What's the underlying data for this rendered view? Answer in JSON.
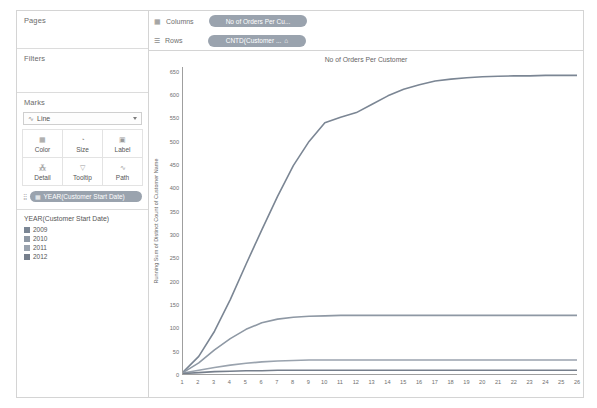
{
  "sidebar": {
    "pages": {
      "label": "Pages"
    },
    "filters": {
      "label": "Filters"
    },
    "marks": {
      "label": "Marks",
      "mark_type": "Line",
      "mark_type_glyph": "∿",
      "buttons": [
        {
          "name": "color",
          "label": "Color",
          "glyph": "▦"
        },
        {
          "name": "size",
          "label": "Size",
          "glyph": "◔"
        },
        {
          "name": "label",
          "label": "Label",
          "glyph": "▣"
        },
        {
          "name": "detail",
          "label": "Detail",
          "glyph": "⁂"
        },
        {
          "name": "tooltip",
          "label": "Tooltip",
          "glyph": "▽"
        },
        {
          "name": "path",
          "label": "Path",
          "glyph": "∿"
        }
      ],
      "pill": {
        "icon": "▦",
        "label": "YEAR(Customer Start Date)"
      }
    },
    "legend": {
      "title": "YEAR(Customer Start Date)",
      "items": [
        {
          "label": "2009",
          "color": "#7b8694"
        },
        {
          "label": "2010",
          "color": "#8e98a4"
        },
        {
          "label": "2011",
          "color": "#9aa3ae"
        },
        {
          "label": "2012",
          "color": "#767f8c"
        }
      ]
    }
  },
  "shelves": {
    "columns": {
      "icon": "▦",
      "label": "Columns",
      "pill": "No of Orders Per Cu..."
    },
    "rows": {
      "icon": "☰",
      "label": "Rows",
      "pill": "CNTD(Customer ...",
      "pill_suffix": "⌂"
    }
  },
  "chart_data": {
    "type": "line",
    "title": "No of Orders Per Customer",
    "xlabel": "",
    "ylabel": "Running Sum of Distinct Count of Customer Name",
    "xlim": [
      1,
      26
    ],
    "ylim": [
      0,
      660
    ],
    "grid": false,
    "legend_position": "sidebar",
    "y_ticks": [
      0,
      50,
      100,
      150,
      200,
      250,
      300,
      350,
      400,
      450,
      500,
      550,
      600,
      650
    ],
    "x_ticks": [
      1,
      2,
      3,
      4,
      5,
      6,
      7,
      8,
      9,
      10,
      11,
      12,
      13,
      14,
      15,
      16,
      17,
      18,
      19,
      20,
      21,
      22,
      23,
      24,
      25,
      26
    ],
    "x": [
      1,
      2,
      3,
      4,
      5,
      6,
      7,
      8,
      9,
      10,
      11,
      12,
      13,
      14,
      15,
      16,
      17,
      18,
      19,
      20,
      21,
      22,
      23,
      24,
      25,
      26
    ],
    "series": [
      {
        "name": "2009",
        "color": "#7b8694",
        "values": [
          4,
          38,
          92,
          160,
          236,
          310,
          382,
          448,
          500,
          540,
          552,
          562,
          580,
          598,
          612,
          622,
          630,
          634,
          637,
          639,
          640,
          641,
          641,
          642,
          642,
          642
        ]
      },
      {
        "name": "2010",
        "color": "#8e98a4",
        "values": [
          3,
          24,
          52,
          76,
          96,
          110,
          118,
          122,
          124,
          125,
          126,
          126,
          126,
          126,
          126,
          126,
          126,
          126,
          126,
          126,
          126,
          126,
          126,
          126,
          126,
          126
        ]
      },
      {
        "name": "2011",
        "color": "#9aa3ae",
        "values": [
          2,
          8,
          14,
          19,
          23,
          26,
          28,
          29,
          30,
          30,
          30,
          30,
          30,
          30,
          30,
          30,
          30,
          30,
          30,
          30,
          30,
          30,
          30,
          30,
          30,
          30
        ]
      },
      {
        "name": "2012",
        "color": "#767f8c",
        "values": [
          1,
          3,
          5,
          6,
          7,
          7,
          8,
          8,
          8,
          8,
          8,
          8,
          8,
          8,
          8,
          8,
          8,
          8,
          8,
          8,
          8,
          8,
          8,
          8,
          8,
          8
        ]
      }
    ]
  }
}
